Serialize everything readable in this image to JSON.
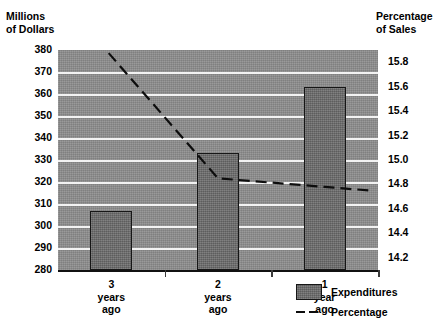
{
  "chart_data": {
    "type": "bar",
    "title": "",
    "subtitle": "",
    "categories": [
      "3\nyears\nago",
      "2\nyears\nago",
      "1\nyear\nago"
    ],
    "category_lines": [
      [
        "3",
        "years",
        "ago"
      ],
      [
        "2",
        "years",
        "ago"
      ],
      [
        "1",
        "year",
        "ago"
      ]
    ],
    "series": [
      {
        "name": "Expenditures",
        "type": "bar",
        "axis": "left",
        "values": [
          307,
          333,
          363
        ]
      },
      {
        "name": "Percentage",
        "type": "line",
        "axis": "right",
        "style": "dashed",
        "values": [
          15.85,
          14.85,
          14.78
        ]
      }
    ],
    "left_axis": {
      "label": "Millions\nof Dollars",
      "label_lines": [
        "Millions",
        "of Dollars"
      ],
      "ticks": [
        380,
        370,
        360,
        350,
        340,
        330,
        320,
        310,
        300,
        290,
        280
      ],
      "ylim": [
        280,
        380
      ]
    },
    "right_axis": {
      "label": "Percentage\nof Sales",
      "label_lines": [
        "Percentage",
        "of Sales"
      ],
      "ticks": [
        "15.8",
        "15.6",
        "15.4",
        "15.2",
        "15.0",
        "14.8",
        "14.6",
        "14.4",
        "14.2"
      ],
      "ylim": [
        14.1,
        15.9
      ]
    },
    "xlabel": "",
    "grid": true,
    "legend_position": "bottom-right",
    "legend": [
      {
        "label": "Expenditures",
        "marker": "filled-box"
      },
      {
        "label": "Percentage",
        "marker": "dashed-line"
      }
    ],
    "colors": {
      "plot_background": "#8e8e8e",
      "bar_fill": "#6f6f6f",
      "bar_outline": "#161616",
      "gridline": "#f2f2f2",
      "line": "#0d0d0d",
      "text": "#000000"
    }
  }
}
